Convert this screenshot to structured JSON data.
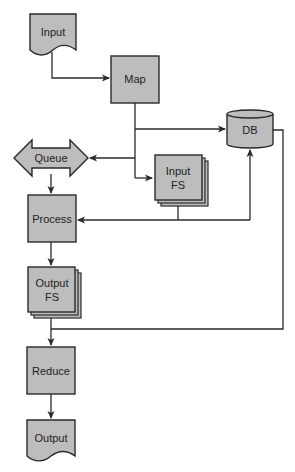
{
  "diagram": {
    "nodes": {
      "input": {
        "label": "Input",
        "shape": "document"
      },
      "map": {
        "label": "Map",
        "shape": "process"
      },
      "db": {
        "label": "DB",
        "shape": "cylinder"
      },
      "queue": {
        "label": "Queue",
        "shape": "double-arrow"
      },
      "input_fs": {
        "label_line1": "Input",
        "label_line2": "FS",
        "shape": "stacked-boxes"
      },
      "process": {
        "label": "Process",
        "shape": "process"
      },
      "output_fs": {
        "label_line1": "Output",
        "label_line2": "FS",
        "shape": "stacked-boxes"
      },
      "reduce": {
        "label": "Reduce",
        "shape": "process"
      },
      "output": {
        "label": "Output",
        "shape": "document"
      }
    },
    "edges": [
      {
        "from": "Input",
        "to": "Map"
      },
      {
        "from": "Map",
        "to": "DB"
      },
      {
        "from": "Map",
        "to": "Queue"
      },
      {
        "from": "Map",
        "to": "Input FS"
      },
      {
        "from": "Queue",
        "to": "Process"
      },
      {
        "from": "Input FS",
        "to": "Process"
      },
      {
        "from": "Input FS",
        "to": "DB"
      },
      {
        "from": "Process",
        "to": "Output FS"
      },
      {
        "from": "DB",
        "to": "Reduce"
      },
      {
        "from": "Output FS",
        "to": "Reduce"
      },
      {
        "from": "Reduce",
        "to": "Output"
      }
    ],
    "colors": {
      "node_fill": "#bdbdbd",
      "stroke": "#2a2a2a",
      "background": "#ffffff"
    }
  }
}
